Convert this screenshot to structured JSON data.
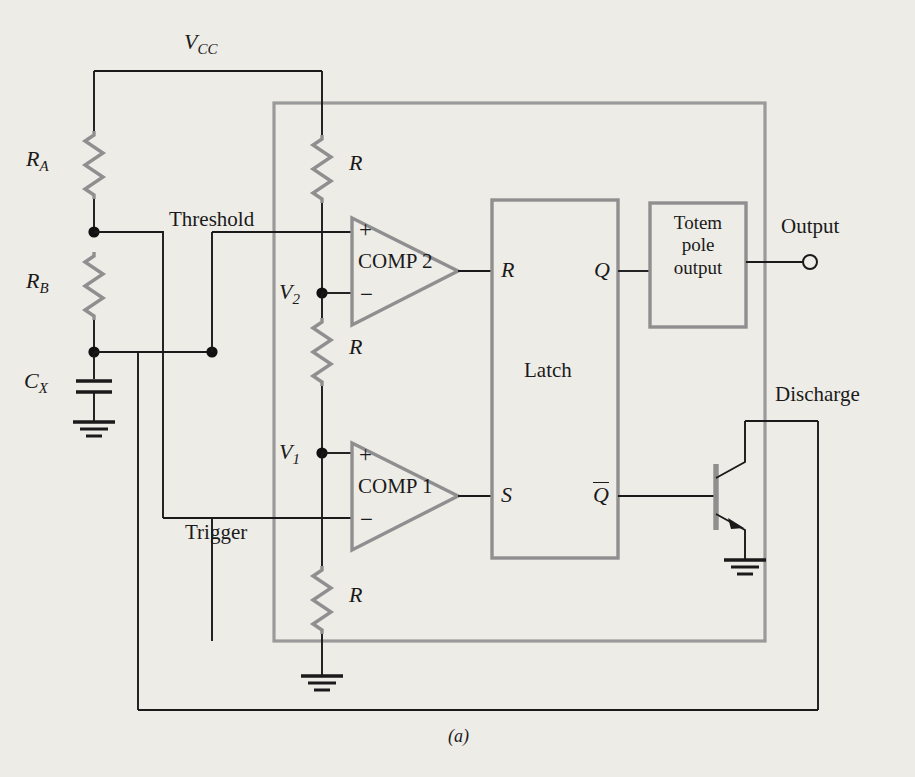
{
  "figure": {
    "caption": "(a)",
    "supply_label": "V",
    "supply_sub": "CC"
  },
  "external_components": {
    "ra_label": "R",
    "ra_sub": "A",
    "rb_label": "R",
    "rb_sub": "B",
    "cx_label": "C",
    "cx_sub": "X"
  },
  "internal_divider": {
    "r_top": "R",
    "r_mid": "R",
    "r_bot": "R",
    "v2_label": "V",
    "v2_sub": "2",
    "v1_label": "V",
    "v1_sub": "1"
  },
  "comparators": [
    {
      "name": "COMP 2",
      "plus": "+",
      "minus": "−"
    },
    {
      "name": "COMP 1",
      "plus": "+",
      "minus": "−"
    }
  ],
  "latch": {
    "title": "Latch",
    "input_r": "R",
    "input_s": "S",
    "output_q": "Q",
    "output_qbar": "Q"
  },
  "output_stage": {
    "line1": "Totem",
    "line2": "pole",
    "line3": "output"
  },
  "pins": {
    "threshold": "Threshold",
    "trigger": "Trigger",
    "output": "Output",
    "discharge": "Discharge"
  },
  "colors": {
    "background": "#eeece7",
    "wire": "#1a1a1a",
    "component_outline": "#8a8a8a",
    "ic_boundary": "#8a8a8a",
    "text": "#1a1a1a"
  }
}
